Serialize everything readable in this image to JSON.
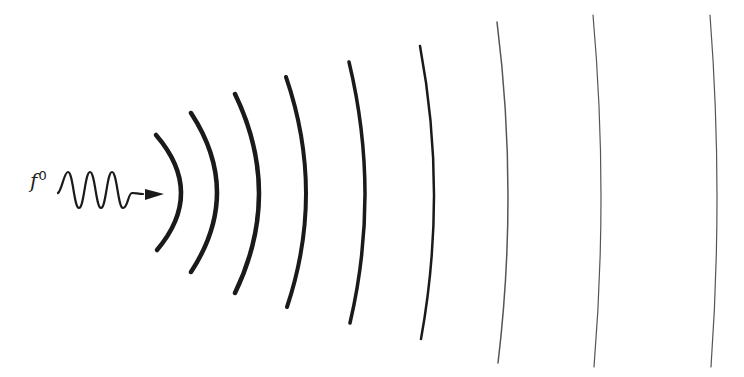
{
  "label": {
    "base": "f",
    "superscript": "0"
  },
  "colors": {
    "stroke": "#1a1a1a",
    "thin_stroke": "#555555",
    "background": "#ffffff"
  },
  "arcs": [
    {
      "top": [
        156,
        135
      ],
      "mid_x": 181,
      "bottom": [
        157,
        250
      ],
      "width": 4.5
    },
    {
      "top": [
        191,
        113
      ],
      "mid_x": 217,
      "bottom": [
        191,
        272
      ],
      "width": 4.5
    },
    {
      "top": [
        235,
        94
      ],
      "mid_x": 259,
      "bottom": [
        235,
        293
      ],
      "width": 4.5
    },
    {
      "top": [
        286,
        77
      ],
      "mid_x": 306,
      "bottom": [
        287,
        307
      ],
      "width": 4
    },
    {
      "top": [
        349,
        62
      ],
      "mid_x": 365,
      "bottom": [
        350,
        323
      ],
      "width": 3.5
    },
    {
      "top": [
        420,
        46
      ],
      "mid_x": 434,
      "bottom": [
        421,
        339
      ],
      "width": 2.5
    },
    {
      "top": [
        497,
        22
      ],
      "mid_x": 508,
      "bottom": [
        498,
        363
      ],
      "width": 1.5
    },
    {
      "top": [
        593,
        15
      ],
      "mid_x": 601,
      "bottom": [
        594,
        367
      ],
      "width": 1.2
    },
    {
      "top": [
        710,
        15
      ],
      "mid_x": 717,
      "bottom": [
        711,
        367
      ],
      "width": 1.2
    }
  ]
}
